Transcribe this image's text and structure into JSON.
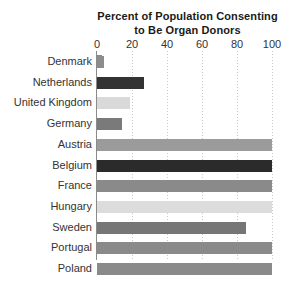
{
  "chart_data": {
    "type": "bar",
    "orientation": "horizontal",
    "title": "Percent of Population Consenting to Be Organ Donors",
    "title_lines": [
      "Percent of Population Consenting",
      "to Be Organ Donors"
    ],
    "xlabel": "",
    "ylabel": "",
    "xlim": [
      0,
      100
    ],
    "xticks": [
      0,
      20,
      40,
      60,
      80,
      100
    ],
    "xtick_labels": [
      "0",
      "20",
      "40",
      "60",
      "80",
      "100"
    ],
    "grid": "vertical-dotted",
    "legend": "none",
    "categories": [
      "Denmark",
      "Netherlands",
      "United Kingdom",
      "Germany",
      "Austria",
      "Belgium",
      "France",
      "Hungary",
      "Sweden",
      "Portugal",
      "Poland"
    ],
    "values": [
      4,
      27,
      19,
      14,
      100,
      100,
      100,
      100,
      85,
      100,
      100
    ],
    "bar_colors": [
      "#8c8c8c",
      "#333333",
      "#d9d9d9",
      "#7a7a7a",
      "#9b9b9b",
      "#2b2b2b",
      "#8a8a8a",
      "#dcdcdc",
      "#767676",
      "#8a8a8a",
      "#8a8a8a"
    ]
  },
  "style": {
    "background_color": "#ffffff",
    "axis_color": "#8a8a8a",
    "gridline_color": "#c8c8c8",
    "text_color": "#333333",
    "title_color": "#1a1a1a"
  }
}
